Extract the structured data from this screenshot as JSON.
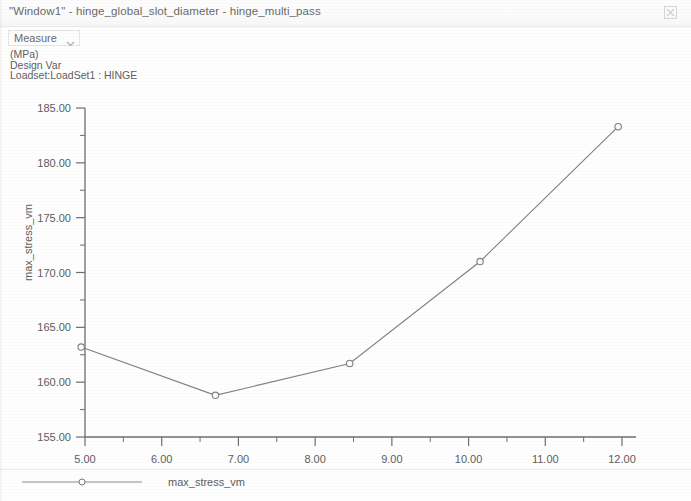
{
  "window": {
    "title": "\"Window1\" - hinge_global_slot_diameter - hinge_multi_pass",
    "close_icon": "close-icon"
  },
  "toolbar": {
    "measure_label": "Measure",
    "chevron_icon": "chevron-down-icon"
  },
  "annotations": {
    "units": "(MPa)",
    "design_var": "Design Var",
    "loadset": "Loadset:LoadSet1 :  HINGE"
  },
  "legend": {
    "series_label": "max_stress_vm",
    "marker_icon": "circle-marker-icon"
  },
  "chart_data": {
    "type": "line",
    "title": "",
    "xlabel": "slot_diameter:HINGE",
    "ylabel": "max_stress_vm",
    "units": "(MPa)",
    "xlim": [
      4.5,
      12.4
    ],
    "ylim": [
      155.0,
      186.0
    ],
    "xticks": [
      5.0,
      6.0,
      7.0,
      8.0,
      9.0,
      10.0,
      11.0,
      12.0
    ],
    "xtick_labels": [
      "5.00",
      "6.00",
      "7.00",
      "8.00",
      "9.00",
      "10.00",
      "11.00",
      "12.00"
    ],
    "yticks": [
      155.0,
      160.0,
      165.0,
      170.0,
      175.0,
      180.0,
      185.0
    ],
    "ytick_labels": [
      "155.00",
      "160.00",
      "165.00",
      "170.00",
      "175.00",
      "180.00",
      "185.00"
    ],
    "minor_xticks": [
      5.5,
      6.5,
      7.5,
      8.5,
      9.5,
      10.5,
      11.5
    ],
    "minor_yticks": [
      157.5,
      162.5,
      167.5,
      172.5,
      177.5,
      182.5
    ],
    "grid": false,
    "legend_position": "bottom-left",
    "line_color": "#808080",
    "marker_color": "#808080",
    "axis_color": "#6e6e6e",
    "series": [
      {
        "name": "max_stress_vm",
        "x": [
          4.95,
          6.7,
          8.45,
          10.15,
          11.95
        ],
        "y": [
          163.2,
          158.8,
          161.7,
          171.0,
          183.3
        ]
      }
    ]
  }
}
